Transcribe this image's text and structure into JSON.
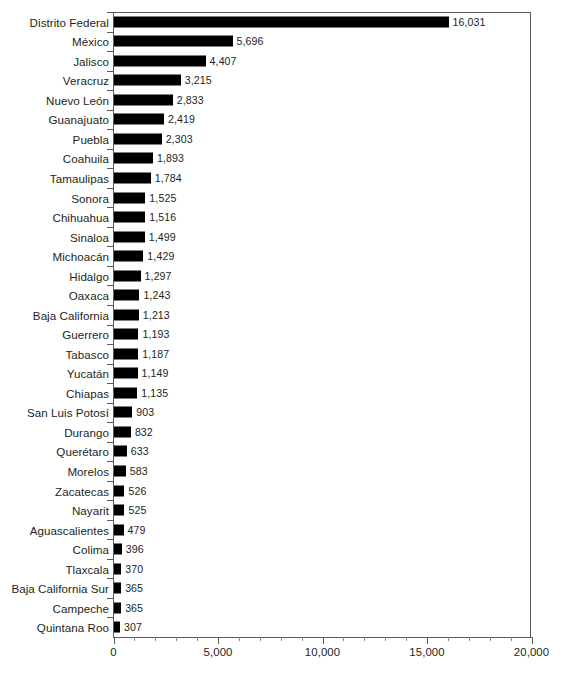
{
  "chart_data": {
    "type": "bar",
    "orientation": "horizontal",
    "title": "",
    "subtitle": "",
    "xlabel": "",
    "ylabel": "",
    "xlim": [
      0,
      20000
    ],
    "ylim": null,
    "grid": false,
    "legend": null,
    "bar_color": "#000000",
    "axis_color": "#58595b",
    "text_color": "#231f20",
    "background_color": "#ffffff",
    "xticks": [
      0,
      5000,
      10000,
      15000,
      20000
    ],
    "xtick_labels": [
      "0",
      "5,000",
      "10,000",
      "15,000",
      "20,000"
    ],
    "minor_tick_interval": 1000,
    "categories": [
      "Distrito Federal",
      "México",
      "Jalisco",
      "Veracruz",
      "Nuevo León",
      "Guanajuato",
      "Puebla",
      "Coahuila",
      "Tamaulipas",
      "Sonora",
      "Chihuahua",
      "Sinaloa",
      "Michoacán",
      "Hidalgo",
      "Oaxaca",
      "Baja California",
      "Guerrero",
      "Tabasco",
      "Yucatán",
      "Chiapas",
      "San Luis Potosí",
      "Durango",
      "Querétaro",
      "Morelos",
      "Zacatecas",
      "Nayarit",
      "Aguascalientes",
      "Colima",
      "Tlaxcala",
      "Baja California Sur",
      "Campeche",
      "Quintana Roo"
    ],
    "values": [
      16031,
      5696,
      4407,
      3215,
      2833,
      2419,
      2303,
      1893,
      1784,
      1525,
      1516,
      1499,
      1429,
      1297,
      1243,
      1213,
      1193,
      1187,
      1149,
      1135,
      903,
      832,
      633,
      583,
      526,
      525,
      479,
      396,
      370,
      365,
      365,
      307
    ],
    "data_labels": [
      "16,031",
      "5,696",
      "4,407",
      "3,215",
      "2,833",
      "2,419",
      "2,303",
      "1,893",
      "1,784",
      "1,525",
      "1,516",
      "1,499",
      "1,429",
      "1,297",
      "1,243",
      "1,213",
      "1,193",
      "1,187",
      "1,149",
      "1,135",
      "903",
      "832",
      "633",
      "583",
      "526",
      "525",
      "479",
      "396",
      "370",
      "365",
      "365",
      "307"
    ]
  }
}
